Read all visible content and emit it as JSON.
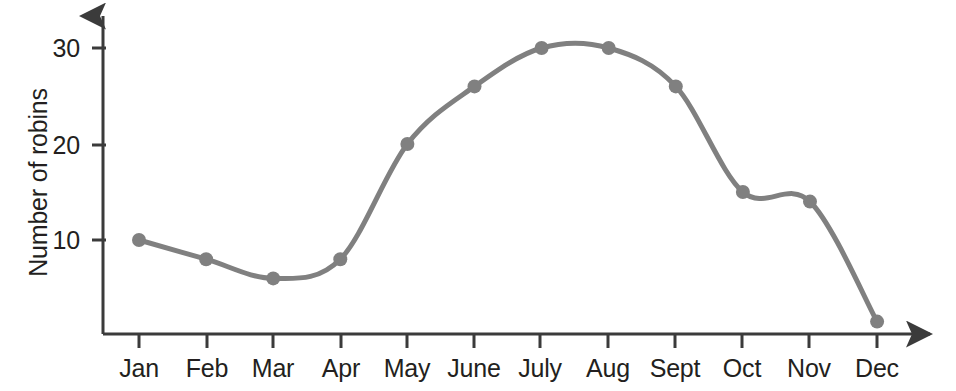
{
  "chart_data": {
    "type": "line",
    "title": "",
    "subtitle": "",
    "xlabel": "",
    "ylabel": "Number of robins",
    "categories": [
      "Jan",
      "Feb",
      "Mar",
      "Apr",
      "May",
      "June",
      "July",
      "Aug",
      "Sept",
      "Oct",
      "Nov",
      "Dec"
    ],
    "values": [
      10,
      8,
      6,
      8,
      20,
      26,
      30,
      30,
      26,
      15,
      14,
      1.5
    ],
    "series": [
      {
        "name": "Number of robins",
        "values": [
          10,
          8,
          6,
          8,
          20,
          26,
          30,
          30,
          26,
          15,
          14,
          1.5
        ]
      }
    ],
    "ytick_labels": [
      "10",
      "20",
      "30"
    ],
    "ytick_values": [
      10,
      20,
      30
    ],
    "ylim": [
      0,
      33
    ],
    "xlim": [
      0,
      13
    ],
    "grid": false,
    "legend": false,
    "legend_position": "none",
    "line_color": "#808080",
    "marker_color": "#808080",
    "axis_color": "#3b3b3b",
    "text_color": "#231f20",
    "marker": "circle",
    "smoothing": true,
    "annotations": []
  },
  "axes": {
    "y_title": "Number of robins",
    "y_ticks": [
      {
        "label": "30",
        "value": 30
      },
      {
        "label": "20",
        "value": 20
      },
      {
        "label": "10",
        "value": 10
      }
    ],
    "x_ticks": [
      {
        "label": "Jan",
        "value": 1
      },
      {
        "label": "Feb",
        "value": 2
      },
      {
        "label": "Mar",
        "value": 3
      },
      {
        "label": "Apr",
        "value": 4
      },
      {
        "label": "May",
        "value": 5
      },
      {
        "label": "June",
        "value": 6
      },
      {
        "label": "July",
        "value": 7
      },
      {
        "label": "Aug",
        "value": 8
      },
      {
        "label": "Sept",
        "value": 9
      },
      {
        "label": "Oct",
        "value": 10
      },
      {
        "label": "Nov",
        "value": 11
      },
      {
        "label": "Dec",
        "value": 12
      }
    ]
  }
}
